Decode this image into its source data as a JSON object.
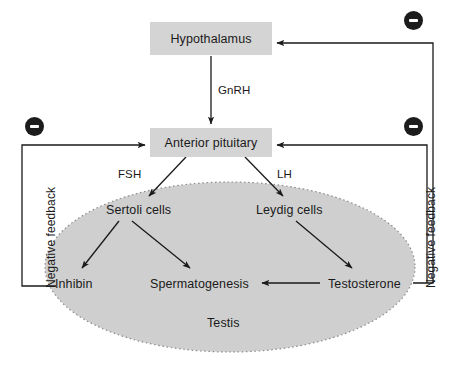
{
  "diagram": {
    "background_color": "#ffffff",
    "box_fill_color": "#d4d4d4",
    "testis_fill_color": "#cfcfcf",
    "line_color": "#1a1a1a",
    "badge_color": "#1c1c1c",
    "nodes": {
      "hypothalamus": "Hypothalamus",
      "anterior_pituitary": "Anterior pituitary",
      "sertoli_cells": "Sertoli cells",
      "leydig_cells": "Leydig cells",
      "inhibin": "Inhibin",
      "spermatogenesis": "Spermatogenesis",
      "testosterone": "Testosterone",
      "testis": "Testis"
    },
    "edge_labels": {
      "gnrh": "GnRH",
      "fsh": "FSH",
      "lh": "LH"
    },
    "feedback_labels": {
      "left": "Negative feedback",
      "right": "Negative feedback"
    },
    "badges": {
      "minus_symbol": "minus-sign",
      "count": 3,
      "names": [
        "negative-feedback-badge-top-right",
        "negative-feedback-badge-left",
        "negative-feedback-badge-right"
      ]
    }
  }
}
